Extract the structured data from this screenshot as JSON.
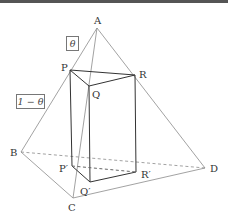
{
  "figure": {
    "type": "tetrahedron-with-inscribed-prism",
    "vertices": {
      "A": "A",
      "B": "B",
      "C": "C",
      "D": "D"
    },
    "prism_top": {
      "P": "P",
      "Q": "Q",
      "R": "R"
    },
    "prism_bottom": {
      "P1": "P′",
      "Q1": "Q′",
      "R1": "R′"
    },
    "ratio_labels": {
      "upper": "θ",
      "lower": "1 − θ"
    },
    "colors": {
      "edge": "#888888",
      "prism": "#333333",
      "hidden": "#999999"
    }
  }
}
